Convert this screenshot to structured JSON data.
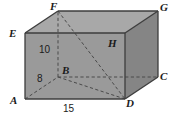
{
  "figure": {
    "type": "rectangular-prism-diagram",
    "title": "",
    "colors": {
      "front_face": "#9a9a9a",
      "top_face": "#a6a6a6",
      "right_face": "#868686",
      "outline": "#3d3d3d",
      "hidden_edge": "#4a4a4a",
      "label_text": "#1b1b1b",
      "background": "#ffffff"
    },
    "vertex_labels": [
      {
        "id": "F",
        "text": "F",
        "x": 50,
        "y": 1
      },
      {
        "id": "G",
        "text": "G",
        "x": 160,
        "y": 2
      },
      {
        "id": "E",
        "text": "E",
        "x": 9,
        "y": 28
      },
      {
        "id": "H",
        "text": "H",
        "x": 108,
        "y": 38
      },
      {
        "id": "B",
        "text": "B",
        "x": 62,
        "y": 65
      },
      {
        "id": "C",
        "text": "C",
        "x": 160,
        "y": 71
      },
      {
        "id": "A",
        "text": "A",
        "x": 10,
        "y": 95
      },
      {
        "id": "D",
        "text": "D",
        "x": 126,
        "y": 98
      }
    ],
    "dimension_labels": [
      {
        "id": "height",
        "text": "10",
        "x": 39,
        "y": 45,
        "edge": "F-B"
      },
      {
        "id": "depth",
        "text": "8",
        "x": 37,
        "y": 74,
        "edge": "A-B"
      },
      {
        "id": "width",
        "text": "15",
        "x": 63,
        "y": 104,
        "edge": "A-D"
      }
    ],
    "vertices": {
      "A": {
        "x": 25,
        "y": 99
      },
      "D": {
        "x": 125,
        "y": 99
      },
      "E": {
        "x": 25,
        "y": 33
      },
      "H": {
        "x": 125,
        "y": 33
      },
      "B": {
        "x": 58,
        "y": 77
      },
      "C": {
        "x": 158,
        "y": 77
      },
      "F": {
        "x": 58,
        "y": 11
      },
      "G": {
        "x": 158,
        "y": 11
      }
    },
    "solid_edges": [
      [
        "A",
        "D"
      ],
      [
        "D",
        "H"
      ],
      [
        "H",
        "E"
      ],
      [
        "E",
        "A"
      ],
      [
        "E",
        "F"
      ],
      [
        "F",
        "G"
      ],
      [
        "G",
        "H"
      ],
      [
        "G",
        "C"
      ],
      [
        "C",
        "D"
      ]
    ],
    "hidden_edges": [
      [
        "A",
        "B"
      ],
      [
        "B",
        "C"
      ],
      [
        "B",
        "F"
      ]
    ],
    "hidden_diagonals": [
      [
        "B",
        "D"
      ],
      [
        "F",
        "D"
      ]
    ]
  }
}
